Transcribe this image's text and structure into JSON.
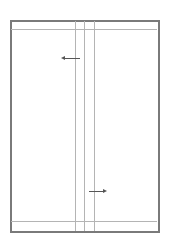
{
  "diagram": {
    "colors": {
      "frame": "#7a7a7a",
      "guide_lines": "#b4b4b4",
      "arrows": "#555555"
    },
    "frame": {
      "x": 10,
      "y": 20,
      "width": 148,
      "height": 211
    },
    "horizontal_lines_y": [
      29,
      221
    ],
    "vertical_lines_x": [
      75,
      84,
      94
    ],
    "arrows": [
      {
        "direction": "left",
        "x1": 80,
        "x2": 62,
        "y": 58
      },
      {
        "direction": "right",
        "x1": 89,
        "x2": 106,
        "y": 191
      }
    ]
  }
}
